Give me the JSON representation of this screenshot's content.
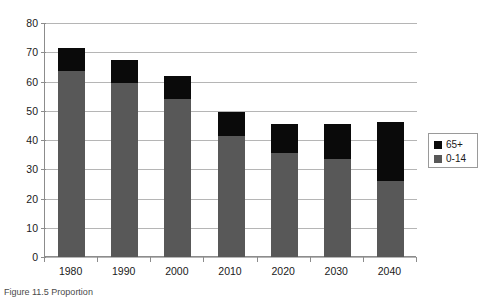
{
  "chart_data": {
    "type": "bar",
    "subtype": "stacked-vertical",
    "title": "",
    "xlabel": "",
    "ylabel": "",
    "categories": [
      "1980",
      "1990",
      "2000",
      "2010",
      "2020",
      "2030",
      "2040"
    ],
    "series": [
      {
        "name": "0-14",
        "color": "#585858",
        "values": [
          63.5,
          59.5,
          54.0,
          41.5,
          35.5,
          33.5,
          26.0
        ]
      },
      {
        "name": "65+",
        "color": "#0a0a0a",
        "values": [
          8.0,
          8.0,
          8.0,
          8.0,
          10.0,
          12.0,
          20.0
        ]
      }
    ],
    "totals": [
      71.5,
      67.5,
      62.0,
      49.5,
      45.5,
      45.5,
      46.0
    ],
    "ylim": [
      0,
      80
    ],
    "ytick_labels": [
      "0",
      "10",
      "20",
      "30",
      "40",
      "50",
      "60",
      "70",
      "80"
    ],
    "ytick_values": [
      0,
      10,
      20,
      30,
      40,
      50,
      60,
      70,
      80
    ],
    "grid": true,
    "grid_axis": "y",
    "legend_position": "right",
    "legend_entries": [
      {
        "label": "65+",
        "color": "#0a0a0a"
      },
      {
        "label": "0-14",
        "color": "#585858"
      }
    ]
  },
  "legend": {
    "old_label": "65+",
    "young_label": "0-14"
  },
  "caption": {
    "text": "Figure 11.5 Proportion"
  }
}
